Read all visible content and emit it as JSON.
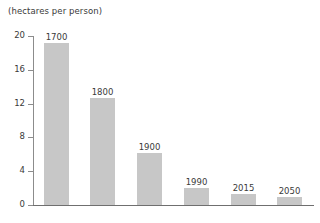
{
  "chart_data": {
    "type": "bar",
    "title": "(hectares per person)",
    "xlabel": "",
    "ylabel": "",
    "ylim": [
      0,
      20
    ],
    "yticks": [
      0,
      4,
      8,
      12,
      16,
      20
    ],
    "ytick_labels": [
      "0",
      "4",
      "8",
      "12",
      "16",
      "20"
    ],
    "grid": false,
    "legend": "none",
    "bar_color": "#c7c7c7",
    "axis_color": "#7a7a7a",
    "categories": [
      "1700",
      "1800",
      "1900",
      "1990",
      "2015",
      "2050"
    ],
    "values": [
      19.2,
      12.7,
      6.2,
      2.0,
      1.3,
      1.0
    ],
    "bar_labels": [
      "1700",
      "1800",
      "1900",
      "1990",
      "2015",
      "2050"
    ],
    "bar_label_position": "above"
  }
}
